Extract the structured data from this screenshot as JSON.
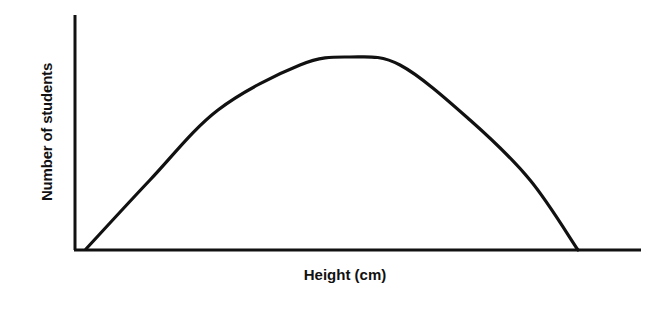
{
  "chart_data": {
    "type": "line",
    "title": "",
    "xlabel": "Height (cm)",
    "ylabel": "Number of students",
    "grid": false,
    "legend": null,
    "series": [
      {
        "name": "distribution",
        "shape": "bell-curve",
        "points_px": [
          [
            86,
            249
          ],
          [
            150,
            180
          ],
          [
            218,
            110
          ],
          [
            300,
            65
          ],
          [
            350,
            57
          ],
          [
            400,
            65
          ],
          [
            470,
            120
          ],
          [
            530,
            180
          ],
          [
            578,
            250
          ]
        ]
      }
    ]
  },
  "labels": {
    "x_axis": "Height (cm)",
    "y_axis": "Number of students"
  },
  "colors": {
    "line": "#111111",
    "background": "#ffffff"
  }
}
